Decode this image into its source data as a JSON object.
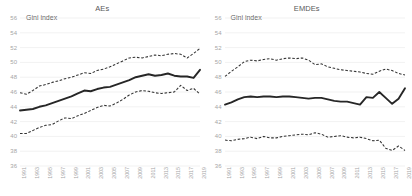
{
  "chart_data": [
    {
      "type": "line",
      "title": "AEs",
      "ylabel": "Gini index",
      "xlabel": "",
      "ylim": [
        36,
        56
      ],
      "yticks": [
        36,
        38,
        40,
        42,
        44,
        46,
        48,
        50,
        52,
        54,
        56
      ],
      "grid": true,
      "legend": "none",
      "x": [
        1991,
        1992,
        1993,
        1994,
        1995,
        1996,
        1997,
        1998,
        1999,
        2000,
        2001,
        2002,
        2003,
        2004,
        2005,
        2006,
        2007,
        2008,
        2009,
        2010,
        2011,
        2012,
        2013,
        2014,
        2015,
        2016,
        2017,
        2018,
        2019
      ],
      "xtick_labels": [
        "1991",
        "1993",
        "1995",
        "1997",
        "1999",
        "2001",
        "2003",
        "2005",
        "2007",
        "2009",
        "2011",
        "2013",
        "2015",
        "2017",
        "2019"
      ],
      "series": [
        {
          "name": "Upper band",
          "style": "dashed",
          "values": [
            45.9,
            45.7,
            46.2,
            46.8,
            47.0,
            47.3,
            47.5,
            47.8,
            48.0,
            48.3,
            48.6,
            48.5,
            48.9,
            49.1,
            49.4,
            49.8,
            50.2,
            50.6,
            50.7,
            50.6,
            50.8,
            51.0,
            50.9,
            51.1,
            51.2,
            51.1,
            50.6,
            51.2,
            51.9
          ]
        },
        {
          "name": "Median",
          "style": "solid",
          "values": [
            43.5,
            43.6,
            43.7,
            44.0,
            44.2,
            44.5,
            44.8,
            45.1,
            45.4,
            45.8,
            46.2,
            46.1,
            46.4,
            46.6,
            46.7,
            47.0,
            47.3,
            47.6,
            48.0,
            48.2,
            48.4,
            48.2,
            48.3,
            48.5,
            48.2,
            48.1,
            48.1,
            47.9,
            49.0
          ]
        },
        {
          "name": "Lower band",
          "style": "dashed",
          "values": [
            40.4,
            40.4,
            40.8,
            41.2,
            41.5,
            41.6,
            42.1,
            42.5,
            42.4,
            42.8,
            43.1,
            43.5,
            43.9,
            44.2,
            44.1,
            44.5,
            45.0,
            45.6,
            46.0,
            46.2,
            46.1,
            45.9,
            45.8,
            45.9,
            46.0,
            46.9,
            46.2,
            46.5,
            45.7
          ]
        }
      ]
    },
    {
      "type": "line",
      "title": "EMDEs",
      "ylabel": "Gini index",
      "xlabel": "",
      "ylim": [
        36,
        56
      ],
      "yticks": [
        36,
        38,
        40,
        42,
        44,
        46,
        48,
        50,
        52,
        54,
        56
      ],
      "grid": true,
      "legend": "none",
      "x": [
        1991,
        1992,
        1993,
        1994,
        1995,
        1996,
        1997,
        1998,
        1999,
        2000,
        2001,
        2002,
        2003,
        2004,
        2005,
        2006,
        2007,
        2008,
        2009,
        2010,
        2011,
        2012,
        2013,
        2014,
        2015,
        2016,
        2017,
        2018,
        2019
      ],
      "xtick_labels": [
        "1991",
        "1993",
        "1995",
        "1997",
        "1999",
        "2001",
        "2003",
        "2005",
        "2007",
        "2009",
        "2011",
        "2013",
        "2015",
        "2017",
        "2019"
      ],
      "series": [
        {
          "name": "Upper band",
          "style": "dashed",
          "values": [
            48.1,
            48.8,
            49.4,
            50.1,
            50.3,
            50.2,
            50.4,
            50.5,
            50.3,
            50.5,
            50.6,
            50.5,
            50.6,
            50.3,
            49.7,
            49.8,
            49.4,
            49.2,
            49.0,
            48.9,
            48.8,
            48.7,
            48.5,
            48.4,
            48.8,
            49.1,
            48.9,
            48.5,
            48.3
          ]
        },
        {
          "name": "Median",
          "style": "solid",
          "values": [
            44.3,
            44.6,
            45.0,
            45.3,
            45.4,
            45.3,
            45.4,
            45.4,
            45.3,
            45.4,
            45.4,
            45.3,
            45.2,
            45.1,
            45.2,
            45.2,
            45.0,
            44.8,
            44.7,
            44.7,
            44.5,
            44.3,
            45.3,
            45.2,
            46.0,
            45.2,
            44.4,
            45.1,
            46.5
          ]
        },
        {
          "name": "Lower band",
          "style": "dashed",
          "values": [
            39.5,
            39.4,
            39.6,
            39.7,
            39.9,
            39.7,
            40.0,
            39.8,
            39.8,
            40.0,
            40.1,
            40.2,
            40.3,
            40.2,
            40.5,
            40.3,
            39.9,
            40.0,
            40.1,
            39.9,
            39.8,
            39.9,
            39.7,
            39.4,
            39.5,
            38.4,
            38.1,
            38.7,
            38.1
          ]
        }
      ]
    }
  ]
}
